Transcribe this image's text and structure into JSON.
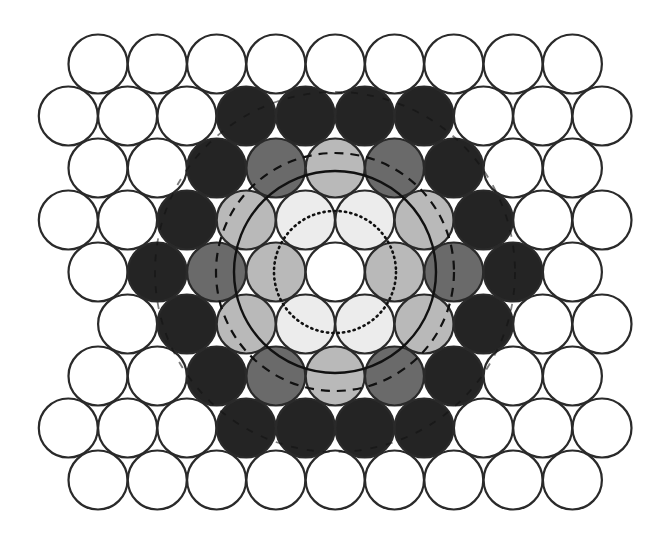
{
  "diagram": {
    "type": "hexagonal-close-packing",
    "center": {
      "x": 335,
      "y": 272
    },
    "spacing_x": 59.3,
    "spacing_y": 52,
    "radius": 29.5,
    "even_row_x0": 98,
    "odd_row_x0": 68.3,
    "colors": {
      "W": "#ffffff",
      "C": "#ffffff",
      "V": "#ececec",
      "L": "#b9b9b9",
      "M": "#6a6a6a",
      "D": "#242424",
      "stroke": "#2a2a2a"
    },
    "legend_shell_names": {
      "C": "central-atom",
      "V": "first-shell",
      "L": "second-shell",
      "M": "third-shell",
      "D": "fourth-shell",
      "W": "unshaded"
    },
    "rows": [
      {
        "parity": "even",
        "cells": [
          "W",
          "W",
          "W",
          "W",
          "W",
          "W",
          "W",
          "W",
          "W"
        ]
      },
      {
        "parity": "odd",
        "cells": [
          "W",
          "W",
          "W",
          "D",
          "D",
          "D",
          "D",
          "W",
          "W",
          "W"
        ]
      },
      {
        "parity": "even",
        "cells": [
          "W",
          "W",
          "D",
          "M",
          "L",
          "M",
          "D",
          "W",
          "W"
        ]
      },
      {
        "parity": "odd",
        "cells": [
          "W",
          "W",
          "D",
          "L",
          "V",
          "V",
          "L",
          "D",
          "W",
          "W"
        ]
      },
      {
        "parity": "even",
        "cells": [
          "W",
          "D",
          "M",
          "L",
          "C",
          "L",
          "M",
          "D",
          "W"
        ]
      },
      {
        "parity": "odd",
        "cells": [
          "-",
          "W",
          "D",
          "L",
          "V",
          "V",
          "L",
          "D",
          "W",
          "W"
        ]
      },
      {
        "parity": "even",
        "cells": [
          "W",
          "W",
          "D",
          "M",
          "L",
          "M",
          "D",
          "W",
          "W"
        ]
      },
      {
        "parity": "odd",
        "cells": [
          "W",
          "W",
          "W",
          "D",
          "D",
          "D",
          "D",
          "W",
          "W",
          "W"
        ]
      },
      {
        "parity": "even",
        "cells": [
          "W",
          "W",
          "W",
          "W",
          "W",
          "W",
          "W",
          "W",
          "W"
        ]
      }
    ],
    "overlay_circles": [
      {
        "name": "dotted-shell-circle",
        "r": 61,
        "style": "dotted",
        "width": 2.6
      },
      {
        "name": "solid-shell-circle",
        "r": 101,
        "style": "solid",
        "width": 2.4
      },
      {
        "name": "dashed-shell-circle",
        "r": 119,
        "style": "dashed",
        "width": 2.2
      },
      {
        "name": "outer-dashed-shell-circle",
        "r": 180,
        "style": "dashed",
        "width": 1.8
      }
    ]
  }
}
